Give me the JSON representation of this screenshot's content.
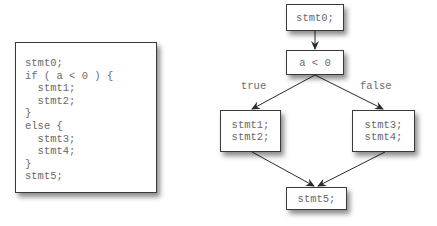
{
  "code_listing": {
    "lines": [
      "stmt0;",
      "if ( a < 0 ) {",
      "  stmt1;",
      "  stmt2;",
      "}",
      "else {",
      "  stmt3;",
      "  stmt4;",
      "}",
      "stmt5;"
    ]
  },
  "flowchart": {
    "nodes": {
      "start": {
        "lines": [
          "stmt0;"
        ]
      },
      "condition": {
        "lines": [
          "a < 0"
        ]
      },
      "true_branch": {
        "lines": [
          "stmt1;",
          "stmt2;"
        ]
      },
      "false_branch": {
        "lines": [
          "stmt3;",
          "stmt4;"
        ]
      },
      "end": {
        "lines": [
          "stmt5;"
        ]
      }
    },
    "edge_labels": {
      "true": "true",
      "false": "false"
    },
    "edges": [
      {
        "from": "start",
        "to": "condition"
      },
      {
        "from": "condition",
        "to": "true_branch",
        "label": "true"
      },
      {
        "from": "condition",
        "to": "false_branch",
        "label": "false"
      },
      {
        "from": "true_branch",
        "to": "end"
      },
      {
        "from": "false_branch",
        "to": "end"
      }
    ]
  }
}
